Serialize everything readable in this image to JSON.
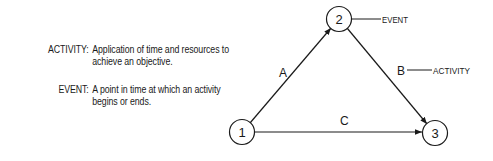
{
  "definitions": [
    {
      "term": "ACTIVITY:",
      "text": "Application of time and resources to achieve an objective."
    },
    {
      "term": "EVENT:",
      "text": "A point in time at which an activity begins or ends."
    }
  ],
  "diagram": {
    "nodes": [
      {
        "id": "1",
        "label": "1"
      },
      {
        "id": "2",
        "label": "2"
      },
      {
        "id": "3",
        "label": "3"
      }
    ],
    "edges": [
      {
        "from": "1",
        "to": "2",
        "label": "A"
      },
      {
        "from": "2",
        "to": "3",
        "label": "B"
      },
      {
        "from": "1",
        "to": "3",
        "label": "C"
      }
    ],
    "callouts": {
      "event": "EVENT",
      "activity": "ACTIVITY"
    }
  }
}
